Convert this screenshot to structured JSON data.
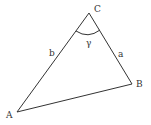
{
  "diagram": {
    "type": "triangle",
    "vertices": [
      {
        "id": "A",
        "label": "A",
        "x": 17,
        "y": 112
      },
      {
        "id": "B",
        "label": "B",
        "x": 132,
        "y": 84
      },
      {
        "id": "C",
        "label": "C",
        "x": 89,
        "y": 13
      }
    ],
    "sides": [
      {
        "id": "a",
        "label": "a",
        "from": "C",
        "to": "B"
      },
      {
        "id": "b",
        "label": "b",
        "from": "A",
        "to": "C"
      },
      {
        "id": "c",
        "label": "",
        "from": "A",
        "to": "B"
      }
    ],
    "angles": [
      {
        "id": "gamma",
        "label": "γ",
        "vertex": "C"
      }
    ],
    "colors": {
      "stroke": "#333333",
      "background": "#ffffff"
    }
  }
}
